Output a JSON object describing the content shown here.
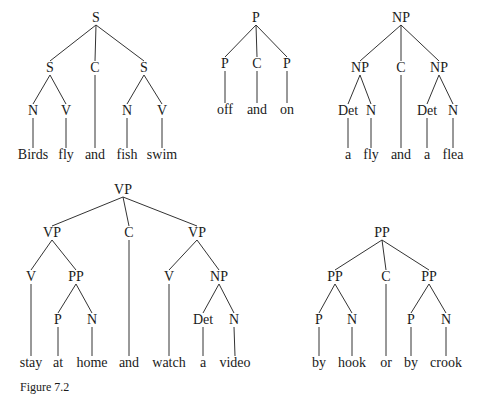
{
  "figure": {
    "caption": "Figure 7.2",
    "trees": [
      {
        "id": "tree-s",
        "nodes": [
          {
            "id": "s0",
            "label": "S",
            "x": 96,
            "y": 18
          },
          {
            "id": "s1",
            "label": "S",
            "x": 50,
            "y": 68,
            "parent": "s0"
          },
          {
            "id": "c1",
            "label": "C",
            "x": 95,
            "y": 68,
            "parent": "s0"
          },
          {
            "id": "s2",
            "label": "S",
            "x": 144,
            "y": 68,
            "parent": "s0"
          },
          {
            "id": "n1",
            "label": "N",
            "x": 33,
            "y": 111,
            "parent": "s1"
          },
          {
            "id": "v1",
            "label": "V",
            "x": 66,
            "y": 111,
            "parent": "s1"
          },
          {
            "id": "n2",
            "label": "N",
            "x": 127,
            "y": 111,
            "parent": "s2"
          },
          {
            "id": "v2",
            "label": "V",
            "x": 162,
            "y": 111,
            "parent": "s2"
          },
          {
            "id": "w1",
            "label": "Birds",
            "x": 33,
            "y": 155,
            "parent": "n1",
            "word": true
          },
          {
            "id": "w2",
            "label": "fly",
            "x": 66,
            "y": 155,
            "parent": "v1",
            "word": true
          },
          {
            "id": "w3",
            "label": "and",
            "x": 95,
            "y": 155,
            "parent": "c1",
            "word": true
          },
          {
            "id": "w4",
            "label": "fish",
            "x": 127,
            "y": 155,
            "parent": "n2",
            "word": true
          },
          {
            "id": "w5",
            "label": "swim",
            "x": 162,
            "y": 155,
            "parent": "v2",
            "word": true
          }
        ]
      },
      {
        "id": "tree-p",
        "nodes": [
          {
            "id": "p0",
            "label": "P",
            "x": 256,
            "y": 18
          },
          {
            "id": "p1",
            "label": "P",
            "x": 225,
            "y": 64,
            "parent": "p0"
          },
          {
            "id": "c1",
            "label": "C",
            "x": 257,
            "y": 64,
            "parent": "p0"
          },
          {
            "id": "p2",
            "label": "P",
            "x": 287,
            "y": 64,
            "parent": "p0"
          },
          {
            "id": "w1",
            "label": "off",
            "x": 225,
            "y": 110,
            "parent": "p1",
            "word": true
          },
          {
            "id": "w2",
            "label": "and",
            "x": 257,
            "y": 110,
            "parent": "c1",
            "word": true
          },
          {
            "id": "w3",
            "label": "on",
            "x": 287,
            "y": 110,
            "parent": "p2",
            "word": true
          }
        ]
      },
      {
        "id": "tree-np",
        "nodes": [
          {
            "id": "np0",
            "label": "NP",
            "x": 401,
            "y": 18
          },
          {
            "id": "np1",
            "label": "NP",
            "x": 360,
            "y": 68,
            "parent": "np0"
          },
          {
            "id": "c1",
            "label": "C",
            "x": 401,
            "y": 68,
            "parent": "np0"
          },
          {
            "id": "np2",
            "label": "NP",
            "x": 439,
            "y": 68,
            "parent": "np0"
          },
          {
            "id": "d1",
            "label": "Det",
            "x": 348,
            "y": 111,
            "parent": "np1"
          },
          {
            "id": "n1",
            "label": "N",
            "x": 371,
            "y": 111,
            "parent": "np1"
          },
          {
            "id": "d2",
            "label": "Det",
            "x": 427,
            "y": 111,
            "parent": "np2"
          },
          {
            "id": "n2",
            "label": "N",
            "x": 453,
            "y": 111,
            "parent": "np2"
          },
          {
            "id": "w1",
            "label": "a",
            "x": 348,
            "y": 155,
            "parent": "d1",
            "word": true
          },
          {
            "id": "w2",
            "label": "fly",
            "x": 371,
            "y": 155,
            "parent": "n1",
            "word": true
          },
          {
            "id": "w3",
            "label": "and",
            "x": 401,
            "y": 155,
            "parent": "c1",
            "word": true
          },
          {
            "id": "w4",
            "label": "a",
            "x": 427,
            "y": 155,
            "parent": "d2",
            "word": true
          },
          {
            "id": "w5",
            "label": "flea",
            "x": 453,
            "y": 155,
            "parent": "n2",
            "word": true
          }
        ]
      },
      {
        "id": "tree-vp",
        "nodes": [
          {
            "id": "vp0",
            "label": "VP",
            "x": 123,
            "y": 190
          },
          {
            "id": "vp1",
            "label": "VP",
            "x": 52,
            "y": 233,
            "parent": "vp0"
          },
          {
            "id": "c1",
            "label": "C",
            "x": 129,
            "y": 233,
            "parent": "vp0"
          },
          {
            "id": "vp2",
            "label": "VP",
            "x": 197,
            "y": 233,
            "parent": "vp0"
          },
          {
            "id": "v1",
            "label": "V",
            "x": 31,
            "y": 277,
            "parent": "vp1"
          },
          {
            "id": "pp1",
            "label": "PP",
            "x": 76,
            "y": 277,
            "parent": "vp1"
          },
          {
            "id": "v2",
            "label": "V",
            "x": 169,
            "y": 277,
            "parent": "vp2"
          },
          {
            "id": "np1",
            "label": "NP",
            "x": 219,
            "y": 277,
            "parent": "vp2"
          },
          {
            "id": "p1",
            "label": "P",
            "x": 58,
            "y": 320,
            "parent": "pp1"
          },
          {
            "id": "n1",
            "label": "N",
            "x": 92,
            "y": 320,
            "parent": "pp1"
          },
          {
            "id": "d1",
            "label": "Det",
            "x": 203,
            "y": 320,
            "parent": "np1"
          },
          {
            "id": "n2",
            "label": "N",
            "x": 234,
            "y": 320,
            "parent": "np1"
          },
          {
            "id": "w1",
            "label": "stay",
            "x": 31,
            "y": 363,
            "parent": "v1",
            "word": true
          },
          {
            "id": "w2",
            "label": "at",
            "x": 58,
            "y": 363,
            "parent": "p1",
            "word": true
          },
          {
            "id": "w3",
            "label": "home",
            "x": 92,
            "y": 363,
            "parent": "n1",
            "word": true
          },
          {
            "id": "w4",
            "label": "and",
            "x": 129,
            "y": 363,
            "parent": "c1",
            "word": true
          },
          {
            "id": "w5",
            "label": "watch",
            "x": 169,
            "y": 363,
            "parent": "v2",
            "word": true
          },
          {
            "id": "w6",
            "label": "a",
            "x": 203,
            "y": 363,
            "parent": "d1",
            "word": true
          },
          {
            "id": "w7",
            "label": "video",
            "x": 235,
            "y": 363,
            "parent": "n2",
            "word": true
          }
        ]
      },
      {
        "id": "tree-pp",
        "nodes": [
          {
            "id": "pp0",
            "label": "PP",
            "x": 382,
            "y": 233
          },
          {
            "id": "pp1",
            "label": "PP",
            "x": 335,
            "y": 277,
            "parent": "pp0"
          },
          {
            "id": "c1",
            "label": "C",
            "x": 386,
            "y": 277,
            "parent": "pp0"
          },
          {
            "id": "pp2",
            "label": "PP",
            "x": 429,
            "y": 277,
            "parent": "pp0"
          },
          {
            "id": "p1",
            "label": "P",
            "x": 319,
            "y": 320,
            "parent": "pp1"
          },
          {
            "id": "n1",
            "label": "N",
            "x": 352,
            "y": 320,
            "parent": "pp1"
          },
          {
            "id": "p2",
            "label": "P",
            "x": 411,
            "y": 320,
            "parent": "pp2"
          },
          {
            "id": "n2",
            "label": "N",
            "x": 446,
            "y": 320,
            "parent": "pp2"
          },
          {
            "id": "w1",
            "label": "by",
            "x": 319,
            "y": 363,
            "parent": "p1",
            "word": true
          },
          {
            "id": "w2",
            "label": "hook",
            "x": 352,
            "y": 363,
            "parent": "n1",
            "word": true
          },
          {
            "id": "w3",
            "label": "or",
            "x": 386,
            "y": 363,
            "parent": "c1",
            "word": true
          },
          {
            "id": "w4",
            "label": "by",
            "x": 411,
            "y": 363,
            "parent": "p2",
            "word": true
          },
          {
            "id": "w5",
            "label": "crook",
            "x": 446,
            "y": 363,
            "parent": "n2",
            "word": true
          }
        ]
      }
    ]
  }
}
